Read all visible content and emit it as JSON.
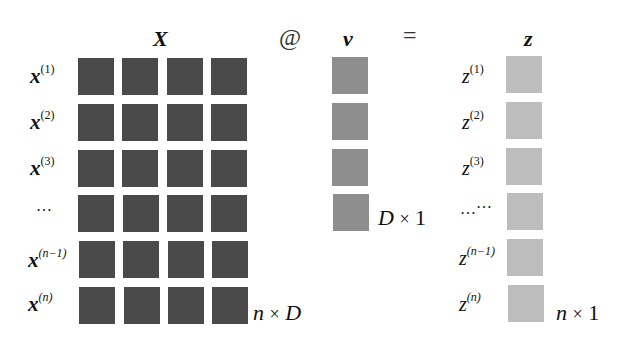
{
  "matrix_X": {
    "header": "X",
    "rows": [
      "x",
      "x",
      "x",
      "…",
      "x",
      "x"
    ],
    "row_superscripts": [
      "(1)",
      "(2)",
      "(3)",
      "",
      "(n−1)",
      "(n)"
    ],
    "dimension_a": "n",
    "dimension_times": "×",
    "dimension_b": "D",
    "fill_color": "#4a4a4a"
  },
  "operator_matmul": "@",
  "vector_v": {
    "header": "v",
    "dimension_a": "D",
    "dimension_times": "×",
    "dimension_b": "1",
    "fill_color": "#8e8e8e"
  },
  "operator_equals": "=",
  "vector_z": {
    "header": "z",
    "rows": [
      "z",
      "z",
      "z",
      "…",
      "z",
      "z"
    ],
    "row_superscripts": [
      "(1)",
      "(2)",
      "(3)",
      "",
      "(n−1)",
      "(n)"
    ],
    "dimension_a": "n",
    "dimension_times": "×",
    "dimension_b": "1",
    "fill_color": "#bdbdbd"
  }
}
